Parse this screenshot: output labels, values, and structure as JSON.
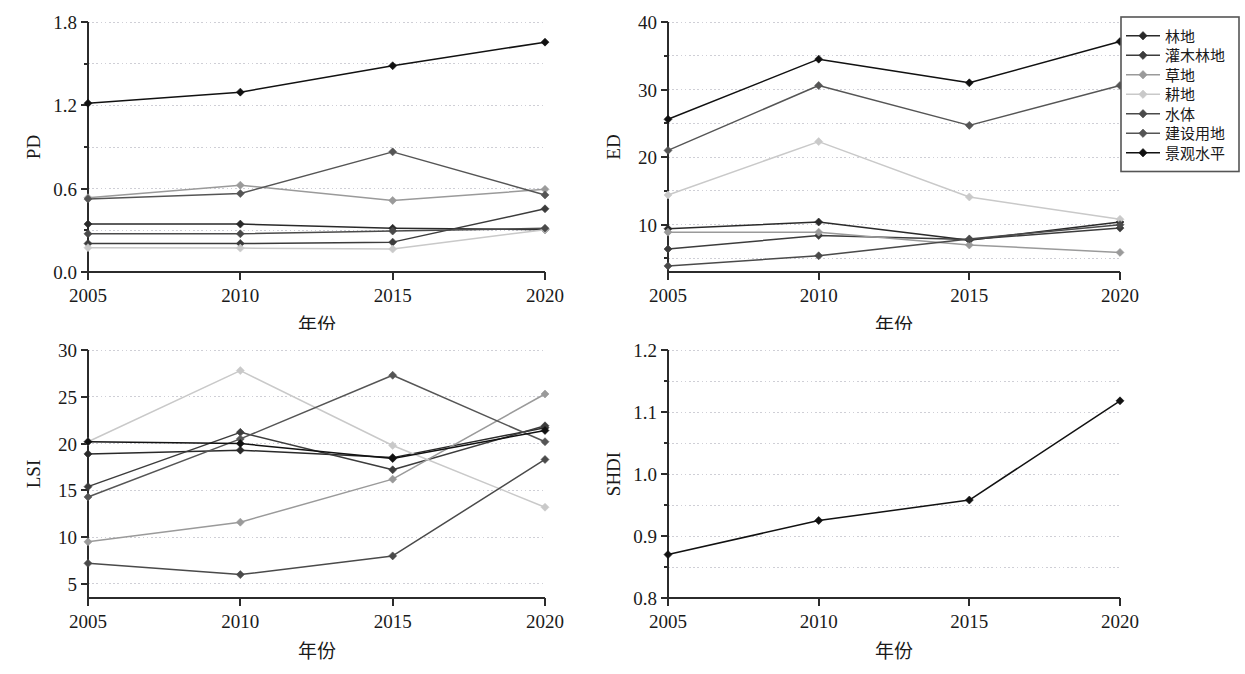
{
  "figure": {
    "title": "",
    "background": "#ffffff",
    "axis_color": "#2b2b2b",
    "grid_color": "#cfcfd6"
  },
  "legend": {
    "position": "top-right",
    "border_color": "#555555",
    "items": [
      {
        "label": "林地",
        "color": "#2a2a2a",
        "key": "forest"
      },
      {
        "label": "灌木林地",
        "color": "#3c3c3c",
        "key": "shrub"
      },
      {
        "label": "草地",
        "color": "#9a9a9a",
        "key": "grass"
      },
      {
        "label": "耕地",
        "color": "#c9c9c9",
        "key": "crop"
      },
      {
        "label": "水体",
        "color": "#4a4a4a",
        "key": "water"
      },
      {
        "label": "建设用地",
        "color": "#555555",
        "key": "built"
      },
      {
        "label": "景观水平",
        "color": "#111111",
        "key": "landscape"
      }
    ]
  },
  "axes": {
    "x_title": "年份",
    "x_categories": [
      "2005",
      "2010",
      "2015",
      "2020"
    ]
  },
  "chart_data": [
    {
      "type": "line",
      "id": "pd",
      "title": "",
      "xlabel": "年份",
      "ylabel": "PD",
      "x": [
        2005,
        2010,
        2015,
        2020
      ],
      "xticklabels": [
        "2005",
        "2010",
        "2015",
        "2020"
      ],
      "ylim": [
        0.0,
        1.8
      ],
      "yticks": [
        0.0,
        0.6,
        1.2,
        1.8
      ],
      "yticklabels": [
        "0.0",
        "0.6",
        "1.2",
        "1.8"
      ],
      "yminorticks": [
        0.3,
        0.9,
        1.5
      ],
      "grid": true,
      "series": [
        {
          "name": "林地",
          "color": "#2a2a2a",
          "values": [
            0.345,
            0.345,
            0.315,
            0.305
          ]
        },
        {
          "name": "灌木林地",
          "color": "#3c3c3c",
          "values": [
            0.205,
            0.205,
            0.215,
            0.455
          ]
        },
        {
          "name": "草地",
          "color": "#9a9a9a",
          "values": [
            0.535,
            0.625,
            0.515,
            0.595
          ]
        },
        {
          "name": "耕地",
          "color": "#c9c9c9",
          "values": [
            0.175,
            0.172,
            0.165,
            0.305
          ]
        },
        {
          "name": "水体",
          "color": "#4a4a4a",
          "values": [
            0.275,
            0.275,
            0.295,
            0.315
          ]
        },
        {
          "name": "建设用地",
          "color": "#555555",
          "value_note": "rises to 2015 then falls",
          "values": [
            0.525,
            0.565,
            0.865,
            0.555
          ]
        },
        {
          "name": "景观水平",
          "color": "#111111",
          "values": [
            1.215,
            1.295,
            1.485,
            1.655
          ]
        }
      ]
    },
    {
      "type": "line",
      "id": "ed",
      "title": "",
      "xlabel": "年份",
      "ylabel": "ED",
      "x": [
        2005,
        2010,
        2015,
        2020
      ],
      "xticklabels": [
        "2005",
        "2010",
        "2015",
        "2020"
      ],
      "ylim": [
        3.0,
        40.0
      ],
      "yticks": [
        10,
        20,
        30,
        40
      ],
      "yticklabels": [
        "10",
        "20",
        "30",
        "40"
      ],
      "yminorticks": [
        5,
        15,
        25,
        35
      ],
      "grid": true,
      "series": [
        {
          "name": "林地",
          "color": "#2a2a2a",
          "values": [
            9.4,
            10.4,
            7.7,
            10.4
          ]
        },
        {
          "name": "灌木林地",
          "color": "#3c3c3c",
          "values": [
            6.4,
            8.4,
            7.8,
            9.5
          ]
        },
        {
          "name": "草地",
          "color": "#9a9a9a",
          "values": [
            8.9,
            8.9,
            7.0,
            5.9
          ]
        },
        {
          "name": "耕地",
          "color": "#c9c9c9",
          "values": [
            14.4,
            22.3,
            14.1,
            10.8
          ]
        },
        {
          "name": "水体",
          "color": "#4a4a4a",
          "values": [
            3.9,
            5.4,
            7.9,
            10.0
          ]
        },
        {
          "name": "建设用地",
          "color": "#555555",
          "values": [
            21.0,
            30.6,
            24.7,
            30.6
          ]
        },
        {
          "name": "景观水平",
          "color": "#111111",
          "values": [
            25.6,
            34.5,
            31.0,
            37.1
          ]
        }
      ]
    },
    {
      "type": "line",
      "id": "lsi",
      "title": "",
      "xlabel": "年份",
      "ylabel": "LSI",
      "x": [
        2005,
        2010,
        2015,
        2020
      ],
      "xticklabels": [
        "2005",
        "2010",
        "2015",
        "2020"
      ],
      "ylim": [
        3.5,
        30.0
      ],
      "yticks": [
        5,
        10,
        15,
        20,
        25,
        30
      ],
      "yticklabels": [
        "5",
        "10",
        "15",
        "20",
        "25",
        "30"
      ],
      "yminorticks": [],
      "grid": true,
      "series": [
        {
          "name": "林地",
          "color": "#2a2a2a",
          "values": [
            18.9,
            19.3,
            18.5,
            21.7
          ]
        },
        {
          "name": "灌木林地",
          "color": "#3c3c3c",
          "values": [
            15.4,
            21.2,
            17.2,
            21.9
          ]
        },
        {
          "name": "草地",
          "color": "#9a9a9a",
          "values": [
            9.5,
            11.6,
            16.2,
            25.3
          ]
        },
        {
          "name": "耕地",
          "color": "#c9c9c9",
          "values": [
            20.2,
            27.8,
            19.8,
            13.2
          ]
        },
        {
          "name": "水体",
          "color": "#4a4a4a",
          "values": [
            7.2,
            6.0,
            8.0,
            18.3
          ]
        },
        {
          "name": "建设用地",
          "color": "#555555",
          "values": [
            14.3,
            20.5,
            27.3,
            20.2
          ]
        },
        {
          "name": "景观水平",
          "color": "#111111",
          "values": [
            20.2,
            20.0,
            18.4,
            21.4
          ]
        }
      ]
    },
    {
      "type": "line",
      "id": "shdi",
      "title": "",
      "xlabel": "年份",
      "ylabel": "SHDI",
      "x": [
        2005,
        2010,
        2015,
        2020
      ],
      "xticklabels": [
        "2005",
        "2010",
        "2015",
        "2020"
      ],
      "ylim": [
        0.8,
        1.2
      ],
      "yticks": [
        0.8,
        0.9,
        1.0,
        1.1,
        1.2
      ],
      "yticklabels": [
        "0.8",
        "0.9",
        "1.0",
        "1.1",
        "1.2"
      ],
      "yminorticks": [
        0.85,
        0.95,
        1.05,
        1.15
      ],
      "grid": true,
      "series": [
        {
          "name": "景观水平",
          "color": "#111111",
          "values": [
            0.87,
            0.925,
            0.958,
            1.118
          ]
        }
      ]
    }
  ]
}
